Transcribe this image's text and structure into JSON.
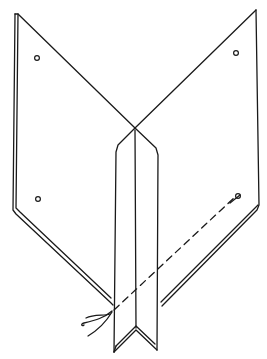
{
  "diagram": {
    "type": "line-drawing",
    "stroke_color": "#1a1a1a",
    "background": "#ffffff",
    "holes": [
      {
        "name": "hole-top-left",
        "cx": 37,
        "cy": 58
      },
      {
        "name": "hole-top-right",
        "cx": 236,
        "cy": 53
      },
      {
        "name": "hole-bottom-left",
        "cx": 37,
        "cy": 199
      },
      {
        "name": "hole-bottom-right",
        "cx": 238,
        "cy": 196
      }
    ]
  }
}
